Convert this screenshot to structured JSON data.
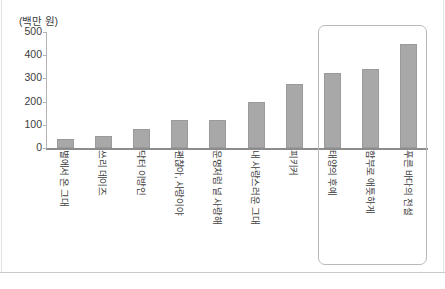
{
  "chart_data": {
    "type": "bar",
    "title": "",
    "subtitle": "",
    "unit_label": "(백만 원)",
    "xlabel": "",
    "ylabel": "",
    "ylim": [
      0,
      500
    ],
    "yticks": [
      0,
      100,
      200,
      300,
      400,
      500
    ],
    "ytick_labels": [
      "0",
      "100",
      "200",
      "300",
      "400",
      "500"
    ],
    "grid": false,
    "legend": null,
    "categories": [
      "별에서 온 그대",
      "쓰리 데이즈",
      "닥터 이방인",
      "괜찮아, 사랑이야",
      "운명처럼 널 사랑해",
      "내 사랑스러운 그대",
      "피키커",
      "태양의 후예",
      "함부로 애틋하게",
      "푸른 바다의 전설"
    ],
    "values": [
      40,
      50,
      80,
      120,
      120,
      200,
      275,
      325,
      340,
      450
    ],
    "bar_color": "#a8a8a8",
    "annotations": [
      {
        "type": "highlight-box",
        "label": "",
        "covers_categories": [
          "태양의 후예",
          "함부로 애틋하게",
          "푸른 바다의 전설"
        ],
        "color": "#b9b9b9"
      }
    ]
  }
}
